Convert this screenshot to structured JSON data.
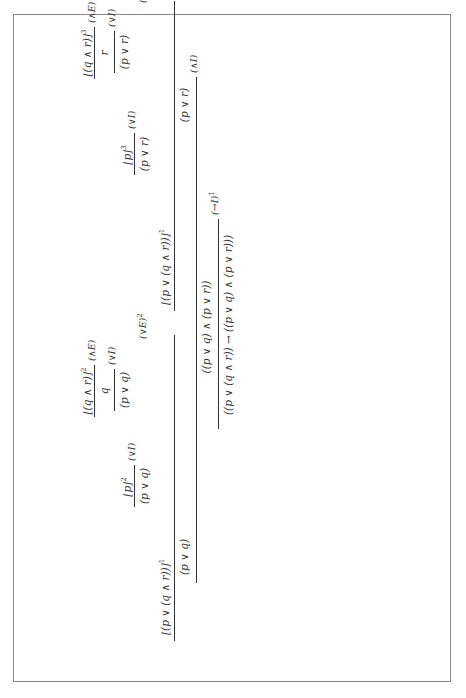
{
  "proof": {
    "left": {
      "major_premise": "⌊(p ∨ (q ∧ r))⌋",
      "major_premise_index": "1",
      "case1_assumption": "⌊p⌋",
      "case1_index": "2",
      "case1_conclusion": "(p ∨ q)",
      "case1_rule": "(∨I)",
      "case2_assumption": "⌊(q ∧ r)⌋",
      "case2_index": "2",
      "case2_step": "q",
      "case2_step_rule": "(∧E)",
      "case2_conclusion": "(p ∨ q)",
      "case2_rule": "(∨I)",
      "conclusion": "(p ∨ q)",
      "rule": "(∨E)",
      "rule_index": "2"
    },
    "right": {
      "major_premise": "⌊(p ∨ (q ∧ r))⌋",
      "major_premise_index": "1",
      "case1_assumption": "⌊p⌋",
      "case1_index": "3",
      "case1_conclusion": "(p ∨ r)",
      "case1_rule": "(∨I)",
      "case2_assumption": "⌊(q ∧ r)⌋",
      "case2_index": "3",
      "case2_step": "r",
      "case2_step_rule": "(∧E)",
      "case2_conclusion": "(p ∨ r)",
      "case2_rule": "(∨I)",
      "conclusion": "(p ∨ r)",
      "rule": "(∨E)",
      "rule_index": "3"
    },
    "conjunction": {
      "conclusion": "((p ∨ q) ∧ (p ∨ r))",
      "rule": "(∧I)"
    },
    "final": {
      "conclusion": "((p ∨ (q ∧ r)) → ((p ∨ q) ∧ (p ∨ r)))",
      "rule": "(→I)",
      "rule_index": "1"
    }
  }
}
